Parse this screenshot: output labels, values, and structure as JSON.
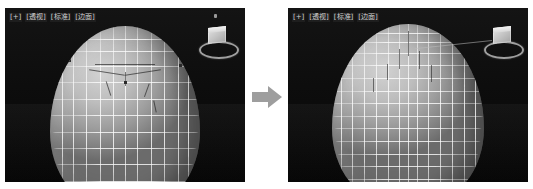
{
  "figure": {
    "type": "before-after-comparison",
    "background_color": "#ffffff",
    "arrow": {
      "direction": "right",
      "color": "#9a9a9a",
      "icon": "arrow-right-icon"
    }
  },
  "panels": [
    {
      "id": "before",
      "position": "left",
      "background_color": "#0a0a0a",
      "viewport_label": {
        "full_text": "[+] [透视] [标准] [边面]",
        "tokens": [
          "[+]",
          "[透视]",
          "[标准]",
          "[边面]"
        ],
        "color": "#cfcfcf"
      },
      "viewcube": {
        "name": "view-cube",
        "has_compass_ring": true
      },
      "model": {
        "name": "egg-shaped-sphere-mesh",
        "shading": "smooth-with-edged-faces",
        "wireframe_color": "#fcfcfc",
        "surface_color": "#b4b4b4",
        "latitude_segments": 12,
        "longitude_segments": 12,
        "selection_visible": true
      }
    },
    {
      "id": "after",
      "position": "right",
      "background_color": "#0a0a0a",
      "viewport_label": {
        "full_text": "[+] [透视] [标准] [边面]",
        "tokens": [
          "[+]",
          "[透视]",
          "[标准]",
          "[边面]"
        ],
        "color": "#cfcfcf"
      },
      "viewcube": {
        "name": "view-cube",
        "has_compass_ring": true
      },
      "model": {
        "name": "egg-shaped-sphere-mesh",
        "shading": "smooth-with-edged-faces",
        "wireframe_color": "#fcfcfc",
        "surface_color": "#b8b8b8",
        "latitude_segments": 16,
        "longitude_segments": 16,
        "selection_visible": false
      },
      "leader_line_visible": true
    }
  ]
}
